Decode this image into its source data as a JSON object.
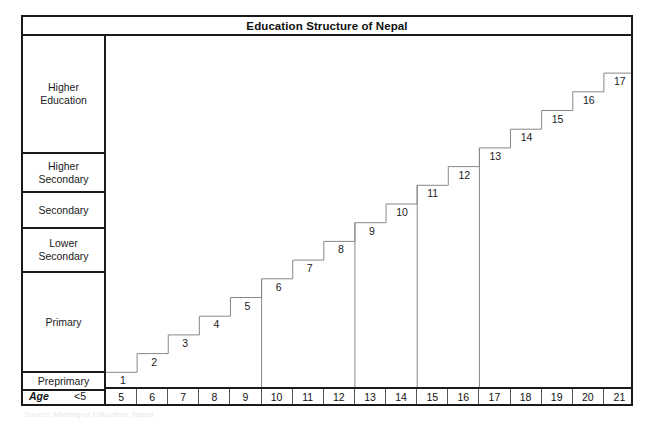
{
  "figure": {
    "title": "Education Structure of Nepal",
    "footer_note": "Source: Ministry of Education, Nepal"
  },
  "levels": [
    {
      "id": "higher-education",
      "label": "Higher\nEducation"
    },
    {
      "id": "higher-secondary",
      "label": "Higher\nSecondary"
    },
    {
      "id": "secondary",
      "label": "Secondary"
    },
    {
      "id": "lower-secondary",
      "label": "Lower\nSecondary"
    },
    {
      "id": "primary",
      "label": "Primary"
    },
    {
      "id": "preprimary",
      "label": "Preprimary"
    }
  ],
  "age_axis": {
    "row_label": "Age",
    "preschool_label": "<5",
    "ticks": [
      "5",
      "6",
      "7",
      "8",
      "9",
      "10",
      "11",
      "12",
      "13",
      "14",
      "15",
      "16",
      "17",
      "18",
      "19",
      "20",
      "21"
    ]
  },
  "chart_data": {
    "type": "line",
    "title": "Education Structure of Nepal",
    "xlabel": "Age",
    "ylabel": "Grade / Year of Schooling",
    "x": [
      5,
      6,
      7,
      8,
      9,
      10,
      11,
      12,
      13,
      14,
      15,
      16,
      17,
      18,
      19,
      20,
      21
    ],
    "values": [
      1,
      2,
      3,
      4,
      5,
      6,
      7,
      8,
      9,
      10,
      11,
      12,
      13,
      14,
      15,
      16,
      17
    ],
    "step_labels": [
      "1",
      "2",
      "3",
      "4",
      "5",
      "6",
      "7",
      "8",
      "9",
      "10",
      "11",
      "12",
      "13",
      "14",
      "15",
      "16",
      "17"
    ],
    "xlim": [
      5,
      22
    ],
    "ylim": [
      0,
      17
    ],
    "grid": false,
    "legend": "none",
    "level_spans": [
      {
        "level": "Preprimary",
        "ages": "<5",
        "grades": []
      },
      {
        "level": "Primary",
        "ages": "5-9",
        "grades": [
          1,
          2,
          3,
          4,
          5
        ]
      },
      {
        "level": "Lower Secondary",
        "ages": "10-12",
        "grades": [
          6,
          7,
          8
        ]
      },
      {
        "level": "Secondary",
        "ages": "13-14",
        "grades": [
          9,
          10
        ]
      },
      {
        "level": "Higher Secondary",
        "ages": "15-16",
        "grades": [
          11,
          12
        ]
      },
      {
        "level": "Higher Education",
        "ages": "17-21",
        "grades": [
          13,
          14,
          15,
          16,
          17
        ]
      }
    ],
    "level_divider_ages": [
      10,
      13,
      15,
      17
    ]
  },
  "colors": {
    "frame": "#1a1a1a",
    "stair_line": "#888888",
    "text": "#1a1a1a",
    "background": "#ffffff"
  }
}
